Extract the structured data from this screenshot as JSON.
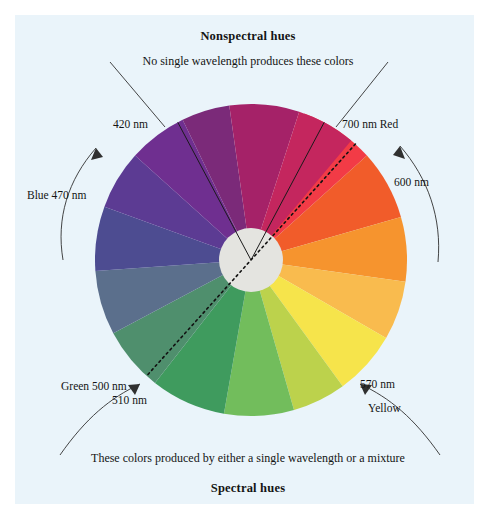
{
  "figure": {
    "kind": "color-wheel-diagram",
    "background": "#eaf4fa",
    "page_background": "#ffffff"
  },
  "headings": {
    "top_title": "Nonspectral hues",
    "top_caption": "No single wavelength produces these colors",
    "bottom_caption": "These colors produced by either a single wavelength or a mixture",
    "bottom_title": "Spectral hues"
  },
  "annotations": [
    {
      "id": "nm-420",
      "text": "420 nm",
      "x": 113,
      "y": 118
    },
    {
      "id": "nm-470-blue",
      "text": "Blue 470 nm",
      "x": 27,
      "y": 189
    },
    {
      "id": "nm-700-red",
      "text": "700 nm Red",
      "x": 342,
      "y": 118
    },
    {
      "id": "nm-600",
      "text": "600 nm",
      "x": 394,
      "y": 176
    },
    {
      "id": "nm-500-green",
      "text": "Green 500 nm",
      "x": 61,
      "y": 380
    },
    {
      "id": "nm-510",
      "text": "510 nm",
      "x": 112,
      "y": 394
    },
    {
      "id": "nm-570",
      "text": "570 nm",
      "x": 360,
      "y": 378
    },
    {
      "id": "nm-yellow",
      "text": "Yellow",
      "x": 368,
      "y": 402
    }
  ],
  "wheel": {
    "center_x": 251,
    "center_y": 260,
    "radius": 156,
    "hub_radius": 32,
    "hub_color": "#e4e4e0",
    "segments": [
      {
        "name": "red",
        "color": "#f23b46",
        "start_deg": -70,
        "end_deg": -42
      },
      {
        "name": "red-orange",
        "color": "#f15c2a",
        "start_deg": -42,
        "end_deg": -16
      },
      {
        "name": "orange",
        "color": "#f6942e",
        "start_deg": -16,
        "end_deg": 8
      },
      {
        "name": "amber",
        "color": "#f9bb4e",
        "start_deg": 8,
        "end_deg": 30
      },
      {
        "name": "yellow",
        "color": "#f6e44b",
        "start_deg": 30,
        "end_deg": 54
      },
      {
        "name": "yellow-green",
        "color": "#bcd24c",
        "start_deg": 54,
        "end_deg": 74
      },
      {
        "name": "light-green",
        "color": "#72bd5c",
        "start_deg": 74,
        "end_deg": 100
      },
      {
        "name": "green",
        "color": "#3f9b5e",
        "start_deg": 100,
        "end_deg": 128
      },
      {
        "name": "teal-green",
        "color": "#4f8f6d",
        "start_deg": 128,
        "end_deg": 152
      },
      {
        "name": "blue-gray",
        "color": "#5b6f8c",
        "start_deg": 152,
        "end_deg": 176
      },
      {
        "name": "slate-blue",
        "color": "#4d4c91",
        "start_deg": 176,
        "end_deg": 200
      },
      {
        "name": "blue-violet",
        "color": "#5c3b93",
        "start_deg": 200,
        "end_deg": 222
      },
      {
        "name": "violet",
        "color": "#6f2f90",
        "start_deg": 222,
        "end_deg": 244
      },
      {
        "name": "purple",
        "color": "#7b2a79",
        "start_deg": 244,
        "end_deg": 262
      },
      {
        "name": "magenta",
        "color": "#a52268",
        "start_deg": 262,
        "end_deg": 288
      },
      {
        "name": "crimson",
        "color": "#c4265e",
        "start_deg": 288,
        "end_deg": 310
      }
    ],
    "nonspectral_wedge": {
      "left_boundary_deg": 242,
      "right_boundary_deg": 298,
      "line_color": "#1a1a1a"
    },
    "spectral_axis": {
      "label": "dotted axis through red and green",
      "from_deg": -48,
      "to_deg": 132,
      "line_color": "#111111",
      "style": "dotted"
    }
  },
  "arrows": [
    {
      "id": "arrow-blue-470",
      "points_to": "420 nm side of wheel",
      "direction": "up-right"
    },
    {
      "id": "arrow-600",
      "points_to": "700 nm Red side of wheel",
      "direction": "up-left"
    },
    {
      "id": "arrow-spectral-left",
      "points_to": "510 nm region",
      "direction": "up-left"
    },
    {
      "id": "arrow-spectral-right",
      "points_to": "Yellow region",
      "direction": "up-right"
    }
  ]
}
